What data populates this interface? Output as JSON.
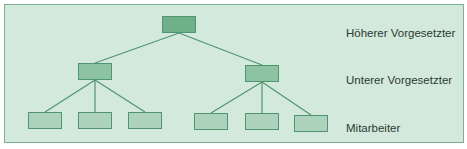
{
  "diagram": {
    "type": "org-hierarchy",
    "levels": [
      {
        "label": "Höherer Vorgesetzter",
        "count": 1
      },
      {
        "label": "Unterer Vorgesetzter",
        "count": 2
      },
      {
        "label": "Mitarbeiter",
        "count": 6
      }
    ],
    "colors": {
      "background": "#d3e9dc",
      "border": "#7fae92",
      "line": "#4f9670",
      "level0_fill": "#6fb08b",
      "level1_fill": "#8dc2a3",
      "level2_fill": "#aed3bc"
    }
  }
}
